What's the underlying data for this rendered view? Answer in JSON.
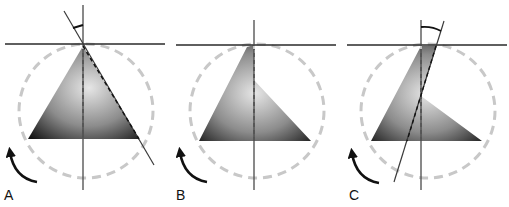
{
  "figure": {
    "panels": [
      {
        "id": "A",
        "label": "A",
        "description": "Triangle with apex on vertical axis; tilted reference line with angle marker"
      },
      {
        "id": "B",
        "label": "B",
        "description": "Triangle rotated so right edge aligns partially with vertical axis"
      },
      {
        "id": "C",
        "label": "C",
        "description": "Further rotated triangle with tilted line crossing vertical axis; angle marker"
      }
    ],
    "colors": {
      "line": "#2a2a2a",
      "circle_dash": "#c8c8c8",
      "shape_dark": "#1a1a1a",
      "shape_light": "#d8d8d8",
      "arrow": "#111111"
    }
  }
}
